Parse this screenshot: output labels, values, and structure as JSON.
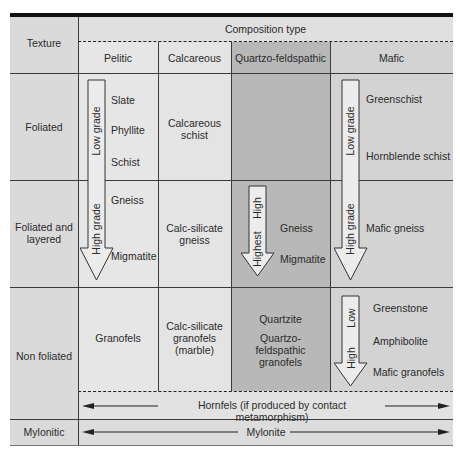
{
  "table": {
    "header": {
      "texture_label": "Texture",
      "composition_label": "Composition type",
      "columns": [
        "Pelitic",
        "Calcareous",
        "Quartzo-feldspathic",
        "Mafic"
      ]
    },
    "rows": [
      {
        "texture": "Foliated",
        "pelitic": [
          "Slate",
          "Phyllite",
          "Schist"
        ],
        "pelitic_arrow_label": "Low grade",
        "calcareous": "Calcareous schist",
        "quartzo_feldspathic": "",
        "mafic": [
          "Greenschist",
          "Hornblende schist"
        ],
        "mafic_arrow_label": "Low grade"
      },
      {
        "texture": "Foliated and layered",
        "pelitic": [
          "Gneiss",
          "Migmatite"
        ],
        "pelitic_arrow_label": "High grade",
        "calcareous": "Calc-silicate gneiss",
        "quartzo_feldspathic": [
          "Gneiss",
          "Migmatite"
        ],
        "qf_arrow_labels": [
          "High",
          "Highest"
        ],
        "mafic": [
          "Mafic gneiss"
        ],
        "mafic_arrow_label": "High grade"
      },
      {
        "texture": "Non foliated",
        "pelitic": "Granofels",
        "calcareous": "Calc-silicate granofels (marble)",
        "quartzo_feldspathic": [
          "Quartzite",
          "Quartzo-feldspathic granofels"
        ],
        "mafic": [
          "Greenstone",
          "Amphibolite",
          "Mafic granofels"
        ],
        "mafic_arrow_labels": [
          "Low",
          "High"
        ],
        "span_note": "Hornfels (if produced by contact metamorphism)"
      },
      {
        "texture": "Mylonitic",
        "span_note": "Mylonite"
      }
    ]
  },
  "colors": {
    "light_cell": "#e4e4e4",
    "texture_col": "#dcdcdc",
    "qf_col": "#b9b9b9",
    "mafic_col": "#d0d0d0",
    "header_bar": "#111111",
    "arrow_fill": "#ececec"
  }
}
